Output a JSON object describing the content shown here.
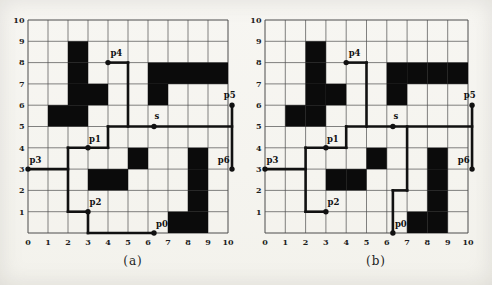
{
  "figure": {
    "colors": {
      "background": "#f6f5f1",
      "grid_line": "#4d4d4d",
      "path_line": "#111111",
      "obstacle": "#0b0b0b",
      "tick_text": "#1d1d1d",
      "label_text": "#111111"
    },
    "axis": {
      "x_ticks": [
        "0",
        "1",
        "2",
        "3",
        "4",
        "5",
        "6",
        "7",
        "8",
        "9",
        "10"
      ],
      "y_ticks": [
        "1",
        "2",
        "3",
        "4",
        "5",
        "6",
        "7",
        "8",
        "9",
        "10"
      ],
      "x_range": [
        0,
        10
      ],
      "y_range": [
        0,
        10
      ]
    },
    "subplots": [
      {
        "id": "a",
        "caption": "(a)",
        "obstacles": [
          [
            1,
            5
          ],
          [
            2,
            5
          ],
          [
            2,
            6
          ],
          [
            3,
            6
          ],
          [
            2,
            7
          ],
          [
            2,
            8
          ],
          [
            6,
            6
          ],
          [
            6,
            7
          ],
          [
            7,
            7
          ],
          [
            8,
            7
          ],
          [
            9,
            7
          ],
          [
            3,
            2
          ],
          [
            4,
            2
          ],
          [
            5,
            3
          ],
          [
            7,
            0
          ],
          [
            8,
            0
          ],
          [
            8,
            1
          ],
          [
            8,
            2
          ],
          [
            8,
            3
          ]
        ],
        "segments": [
          [
            0,
            3,
            2,
            3
          ],
          [
            2,
            1,
            2,
            4
          ],
          [
            2,
            4,
            4,
            4
          ],
          [
            4,
            4,
            4,
            5
          ],
          [
            4,
            5,
            10.2,
            5
          ],
          [
            5,
            5,
            5,
            8
          ],
          [
            4,
            8,
            5,
            8
          ],
          [
            2,
            1,
            3,
            1
          ],
          [
            3,
            0,
            3,
            1
          ],
          [
            3,
            0,
            6.3,
            0
          ],
          [
            10.2,
            3,
            10.2,
            6
          ]
        ],
        "points": [
          {
            "label": "p3",
            "x": 0,
            "y": 3,
            "lx": 0.08,
            "ly": 0.3,
            "anchor": "start"
          },
          {
            "label": "p1",
            "x": 3,
            "y": 4,
            "lx": 0.05,
            "ly": 0.28,
            "anchor": "start"
          },
          {
            "label": "p2",
            "x": 3,
            "y": 1,
            "lx": 0.08,
            "ly": 0.3,
            "anchor": "start"
          },
          {
            "label": "p0",
            "x": 6.3,
            "y": 0,
            "lx": 0.1,
            "ly": 0.28,
            "anchor": "start"
          },
          {
            "label": "p4",
            "x": 4,
            "y": 8,
            "lx": 0.12,
            "ly": 0.3,
            "anchor": "start"
          },
          {
            "label": "s",
            "x": 6.3,
            "y": 5,
            "lx": 0.03,
            "ly": 0.33,
            "anchor": "start"
          },
          {
            "label": "p5",
            "x": 10.2,
            "y": 6,
            "lx": 0.18,
            "ly": 0.33,
            "anchor": "end"
          },
          {
            "label": "p6",
            "x": 10.2,
            "y": 3,
            "lx": -0.12,
            "ly": 0.3,
            "anchor": "end"
          }
        ]
      },
      {
        "id": "b",
        "caption": "(b)",
        "obstacles": [
          [
            1,
            5
          ],
          [
            2,
            5
          ],
          [
            2,
            6
          ],
          [
            3,
            6
          ],
          [
            2,
            7
          ],
          [
            2,
            8
          ],
          [
            6,
            6
          ],
          [
            6,
            7
          ],
          [
            7,
            7
          ],
          [
            8,
            7
          ],
          [
            9,
            7
          ],
          [
            3,
            2
          ],
          [
            4,
            2
          ],
          [
            5,
            3
          ],
          [
            7,
            0
          ],
          [
            8,
            0
          ],
          [
            8,
            1
          ],
          [
            8,
            2
          ],
          [
            8,
            3
          ]
        ],
        "segments": [
          [
            0,
            3,
            2,
            3
          ],
          [
            2,
            1,
            2,
            4
          ],
          [
            2,
            4,
            4,
            4
          ],
          [
            4,
            4,
            4,
            5
          ],
          [
            4,
            5,
            10.2,
            5
          ],
          [
            5,
            5,
            5,
            8
          ],
          [
            4,
            8,
            5,
            8
          ],
          [
            2,
            1,
            3,
            1
          ],
          [
            6.3,
            0,
            6.3,
            2
          ],
          [
            6.3,
            2,
            7,
            2
          ],
          [
            7,
            2,
            7,
            5
          ],
          [
            10.2,
            3,
            10.2,
            6
          ]
        ],
        "points": [
          {
            "label": "p3",
            "x": 0,
            "y": 3,
            "lx": 0.08,
            "ly": 0.3,
            "anchor": "start"
          },
          {
            "label": "p1",
            "x": 3,
            "y": 4,
            "lx": 0.05,
            "ly": 0.28,
            "anchor": "start"
          },
          {
            "label": "p2",
            "x": 3,
            "y": 1,
            "lx": 0.08,
            "ly": 0.3,
            "anchor": "start"
          },
          {
            "label": "p0",
            "x": 6.3,
            "y": 0,
            "lx": 0.1,
            "ly": 0.28,
            "anchor": "start"
          },
          {
            "label": "p4",
            "x": 4,
            "y": 8,
            "lx": 0.12,
            "ly": 0.3,
            "anchor": "start"
          },
          {
            "label": "s",
            "x": 6.3,
            "y": 5,
            "lx": 0.03,
            "ly": 0.33,
            "anchor": "start"
          },
          {
            "label": "p5",
            "x": 10.2,
            "y": 6,
            "lx": 0.18,
            "ly": 0.33,
            "anchor": "end"
          },
          {
            "label": "p6",
            "x": 10.2,
            "y": 3,
            "lx": -0.12,
            "ly": 0.3,
            "anchor": "end"
          }
        ]
      }
    ]
  }
}
